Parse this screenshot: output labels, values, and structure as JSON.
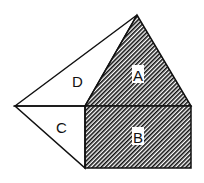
{
  "diagram": {
    "type": "geometry-figure",
    "colors": {
      "stroke": "#111111",
      "fill_hatch": "#111111",
      "background": "#ffffff"
    },
    "vertices": {
      "apex": [
        137,
        15
      ],
      "left": [
        15,
        106
      ],
      "rect_top_left": [
        85,
        106
      ],
      "rect_top_right": [
        191,
        106
      ],
      "rect_bottom_left": [
        85,
        168
      ],
      "rect_bottom_right": [
        191,
        168
      ]
    },
    "regions": [
      {
        "id": "A",
        "label": "A",
        "shape": "triangle",
        "shaded": true
      },
      {
        "id": "B",
        "label": "B",
        "shape": "rectangle",
        "shaded": true
      },
      {
        "id": "C",
        "label": "C",
        "shape": "triangle",
        "shaded": false
      },
      {
        "id": "D",
        "label": "D",
        "shape": "triangle",
        "shaded": false
      }
    ],
    "labels": {
      "A": "A",
      "B": "B",
      "C": "C",
      "D": "D"
    }
  }
}
